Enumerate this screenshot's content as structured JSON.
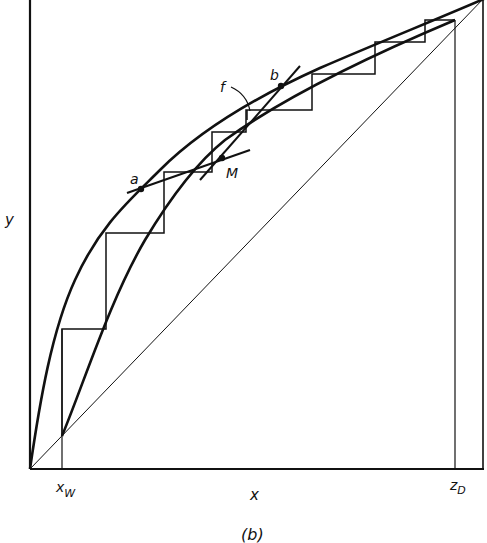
{
  "figure": {
    "caption": "(b)",
    "axes": {
      "x_label": "x",
      "y_label": "y",
      "x_ticks": [
        {
          "label": "x",
          "sub": "W",
          "name": "x-w-tick"
        },
        {
          "label": "z",
          "sub": "D",
          "name": "z-d-tick"
        }
      ]
    },
    "points": {
      "a": "a",
      "b": "b",
      "M": "M",
      "f": "f"
    },
    "curves": [
      {
        "name": "equilibrium-curve",
        "description": "y-x equilibrium curve"
      },
      {
        "name": "operating-curve",
        "description": "lower operating curve from x_W to z_D"
      },
      {
        "name": "diagonal-line",
        "description": "y = x line"
      },
      {
        "name": "feed-line-ab",
        "description": "line through a and M"
      },
      {
        "name": "line-Mb",
        "description": "line through M and b"
      }
    ],
    "stroke_color": "#111111",
    "background": "#ffffff"
  }
}
